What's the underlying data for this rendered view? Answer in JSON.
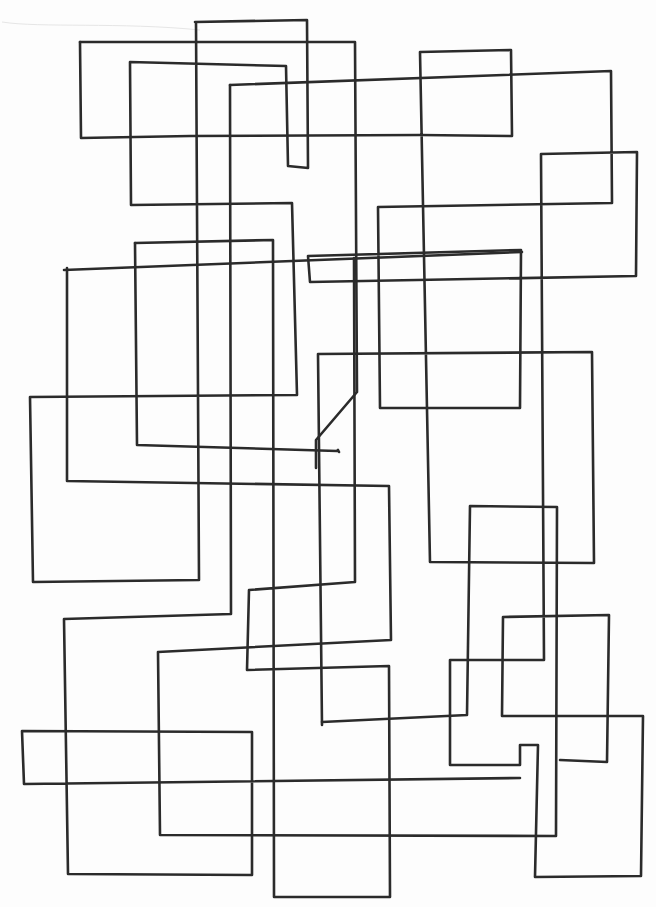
{
  "artwork": {
    "description": "Hand-drawn continuous line of overlapping rectangles",
    "stroke_color": "#2b2b2b",
    "stroke_width": 2.6,
    "background": "#fdfdfd",
    "faint_mark_color": "#e6e6e6",
    "paths": [
      "M195,22 L307,20 L308,168 L288,166 L286,66 L130,62 L131,205 L292,203 L297,395 L30,397 L33,582 L199,580 L196,22",
      "M80,42 L355,42 L357,392 L316,440 L316,468",
      "M80,42 L81,138 L190,136 L420,135 L512,136 L511,50 L420,52 L430,562 L594,563 L592,352 L318,354 L322,725",
      "M230,85 L611,71 L612,203 L378,207 L380,408 L520,408 L521,250 L308,256 L310,282 L636,276 L637,152 L541,154 L544,660 L450,660 L450,765 L520,765 L520,745 L538,745 L535,877 L641,876 L643,716 L502,716 L503,617 L609,615 L607,762 L560,760",
      "M230,85 L231,614 L64,619 L68,874 L252,875 L252,732 L22,731 L24,784 L520,778",
      "M64,270 L522,252",
      "M135,243 L273,240 L274,897 L390,897 L389,666 L247,670 L249,590 L355,582 L354,258",
      "M135,243 L137,445 L337,451 L338,450 L339,452",
      "M67,268 L67,481 L389,486 L391,640 L158,652 L160,835 L556,836 L557,507 L470,506 L467,715 L322,722"
    ]
  }
}
